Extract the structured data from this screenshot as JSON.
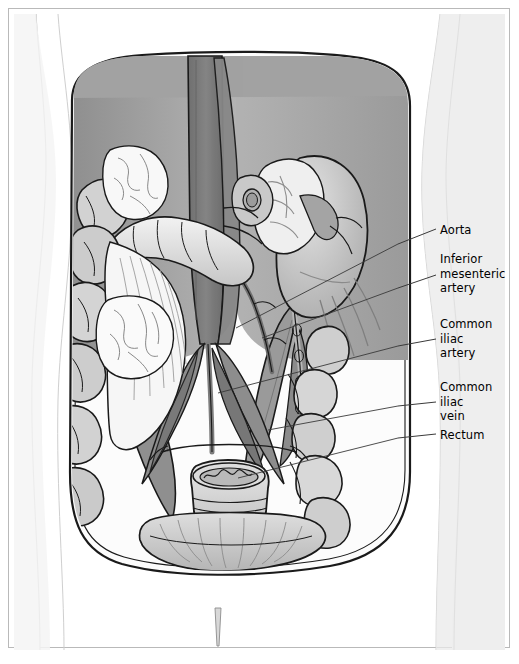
{
  "figure": {
    "type": "medical-illustration",
    "view": "anterior abdominal cavity, viscera partly removed",
    "frame_color": "#b9b9b9",
    "background_color": "#ffffff"
  },
  "palette": {
    "skin_light": "#f2f2f2",
    "body_fill": "#e8e8e8",
    "cavity_fill": "#fbfbfb",
    "muscle_dark": "#8c8c8c",
    "muscle_mid": "#a3a3a3",
    "muscle_light": "#bdbdbd",
    "aorta": "#7e7e7e",
    "vessel_mid": "#949494",
    "organ_light": "#d7d7d7",
    "organ_pale": "#efefef",
    "bowel": "#cfcfcf",
    "outline": "#1a1a1a",
    "leader": "#3a3a3a",
    "text": "#000000"
  },
  "labels": [
    {
      "id": "aorta",
      "text": "Aorta",
      "x": 440,
      "y": 223,
      "leader": {
        "x1": 436,
        "y1": 229,
        "x2": 398,
        "y2": 244
      }
    },
    {
      "id": "inferior-mesenteric-artery",
      "text": "Inferior\nmesenteric\nartery",
      "x": 440,
      "y": 252,
      "leader": {
        "x1": 436,
        "y1": 275,
        "x2": 398,
        "y2": 288
      }
    },
    {
      "id": "common-iliac-artery",
      "text": "Common\niliac\nartery",
      "x": 440,
      "y": 317,
      "leader": {
        "x1": 436,
        "y1": 339,
        "x2": 398,
        "y2": 346
      }
    },
    {
      "id": "common-iliac-vein",
      "text": "Common\niliac\nvein",
      "x": 440,
      "y": 380,
      "leader": {
        "x1": 436,
        "y1": 402,
        "x2": 398,
        "y2": 406
      }
    },
    {
      "id": "rectum",
      "text": "Rectum",
      "x": 440,
      "y": 428,
      "leader": {
        "x1": 436,
        "y1": 434,
        "x2": 398,
        "y2": 438
      }
    }
  ],
  "leader_tails": [
    {
      "id": "aorta-tail",
      "x1": 398,
      "y1": 244,
      "x2": 236,
      "y2": 328
    },
    {
      "id": "ima-tail",
      "x1": 398,
      "y1": 288,
      "x2": 262,
      "y2": 338
    },
    {
      "id": "cia-tail",
      "x1": 398,
      "y1": 346,
      "x2": 218,
      "y2": 393
    },
    {
      "id": "civ-tail",
      "x1": 398,
      "y1": 406,
      "x2": 268,
      "y2": 430
    },
    {
      "id": "rectum-tail",
      "x1": 398,
      "y1": 438,
      "x2": 238,
      "y2": 478
    }
  ],
  "structures": [
    {
      "id": "torso-silhouette",
      "name": "abdominal body wall silhouette"
    },
    {
      "id": "peritoneal-cavity",
      "name": "opened peritoneal cavity"
    },
    {
      "id": "psoas-left",
      "name": "left psoas major muscle"
    },
    {
      "id": "psoas-right",
      "name": "right psoas major muscle"
    },
    {
      "id": "aorta-trunk",
      "name": "abdominal aorta"
    },
    {
      "id": "ivc",
      "name": "inferior vena cava"
    },
    {
      "id": "kidney-right",
      "name": "right kidney"
    },
    {
      "id": "renal-hilum",
      "name": "renal hilum vessels"
    },
    {
      "id": "duodenum",
      "name": "duodenum"
    },
    {
      "id": "descending-colon",
      "name": "descending colon"
    },
    {
      "id": "sigmoid-colon",
      "name": "sigmoid colon"
    },
    {
      "id": "mesentery",
      "name": "mesentery with vessels"
    },
    {
      "id": "rectum-body",
      "name": "rectum"
    },
    {
      "id": "levator-ani",
      "name": "levator ani muscle"
    },
    {
      "id": "probe",
      "name": "probe marker below cavity"
    }
  ]
}
